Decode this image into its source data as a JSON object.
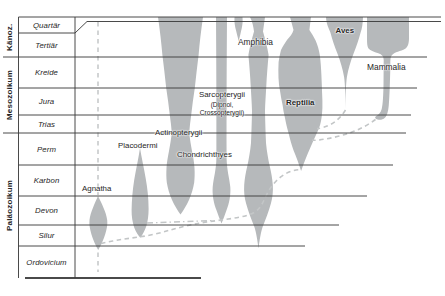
{
  "eras": [
    "Känoz.",
    "Mesozoikum",
    "Paläozoikum"
  ],
  "periods": [
    "Quartär",
    "Tertiär",
    "Kreide",
    "Jura",
    "Trias",
    "Perm",
    "Karbon",
    "Devon",
    "Silur",
    "Ordovicium"
  ],
  "taxa": {
    "agnatha": "Agnatha",
    "placodermi": "Placodermi",
    "chondrichthyes": "Chondrichthyes",
    "actinopterygii": "Actinopterygii",
    "sarcopterygii": "Sarcopterygii",
    "sarcopterygii_sub_1": "(Dipnoi,",
    "sarcopterygii_sub_2": "Crossopterygii)",
    "amphibia": "Amphibia",
    "reptilia": "Reptilia",
    "aves": "Aves",
    "mammalia": "Mammalia"
  },
  "colors": {
    "spindle": "#b6b9bb",
    "line": "#3b3b3b",
    "dashed": "#c3c6c7",
    "text": "#262626",
    "background": "#ffffff"
  }
}
